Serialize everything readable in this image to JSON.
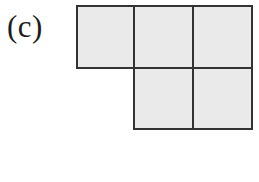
{
  "figure": {
    "panel_label": "(c)",
    "background_color": "#ffffff",
    "cell_fill_color": "#eaeaea",
    "stroke_color": "#333333",
    "stroke_width_px": 2,
    "cell_size_px": 59,
    "cell_count": 5,
    "shape_name": "P-pentomino",
    "grid": {
      "columns": 3,
      "rows": 2,
      "occupied_cells": [
        {
          "row": 0,
          "col": 0
        },
        {
          "row": 0,
          "col": 1
        },
        {
          "row": 0,
          "col": 2
        },
        {
          "row": 1,
          "col": 1
        },
        {
          "row": 1,
          "col": 2
        }
      ]
    },
    "geometry": {
      "x0": 1,
      "x1": 58,
      "x2": 117,
      "x3": 176,
      "y0": 1,
      "y1": 63,
      "y2": 124
    }
  }
}
